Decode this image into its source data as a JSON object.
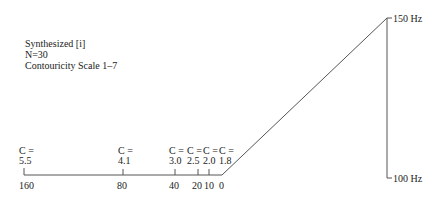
{
  "legend": {
    "line1": "Synthesized [i]",
    "line2": "N=30",
    "line3": "Contouricity Scale 1–7"
  },
  "frequency_scale": {
    "top_label": "150 Hz",
    "bottom_label": "100 Hz"
  },
  "time_axis": {
    "ticks": [
      {
        "label": "160",
        "c_label": "C =",
        "c_value": "5.5"
      },
      {
        "label": "80",
        "c_label": "C =",
        "c_value": "4.1"
      },
      {
        "label": "40",
        "c_label": "C =",
        "c_value": "3.0"
      },
      {
        "label": "20",
        "c_label": "C =",
        "c_value": "2.5"
      },
      {
        "label": "10",
        "c_label": "C =",
        "c_value": "2.0"
      },
      {
        "label": "0",
        "c_label": "C =",
        "c_value": "1.8"
      }
    ]
  },
  "colors": {
    "line": "#555555",
    "text": "#222222"
  }
}
